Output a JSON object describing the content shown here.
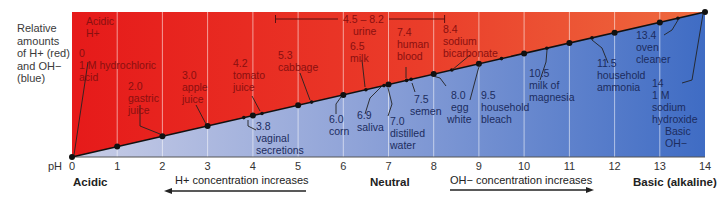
{
  "side_label": {
    "line1": "Relative",
    "line2": "amounts",
    "line3": "of H+ (red)",
    "line4": "and OH−",
    "line5": "(blue)"
  },
  "axis": {
    "ph_label": "pH",
    "ticks": [
      "0",
      "1",
      "2",
      "3",
      "4",
      "5",
      "6",
      "7",
      "8",
      "9",
      "10",
      "11",
      "12",
      "13",
      "14"
    ],
    "acidic": "Acidic",
    "neutral": "Neutral",
    "basic": "Basic (alkaline)"
  },
  "arrows": {
    "left": "H+ concentration increases",
    "right": "OH−  concentration increases"
  },
  "corners": {
    "acidic_top": "Acidic",
    "acidic_ion": "H+",
    "basic_bottom": "Basic",
    "basic_ion": "OH−"
  },
  "colors": {
    "acid_red": "#e8221c",
    "acid_red_light": "#ec5a3a",
    "base_blue": "#4a72c4",
    "base_blue_light": "#b8c4e2",
    "line": "#111111"
  },
  "substances": [
    {
      "ph": "0",
      "name1": "1 M hydrochloric",
      "name2": "acid",
      "side": "red"
    },
    {
      "ph": "2.0",
      "name1": "gastric",
      "name2": "juice",
      "side": "red"
    },
    {
      "ph": "3.0",
      "name1": "apple",
      "name2": "juice",
      "side": "red"
    },
    {
      "ph": "3.8",
      "name1": "vaginal",
      "name2": "secretions",
      "side": "blue"
    },
    {
      "ph": "4.2",
      "name1": "tomato",
      "name2": "juice",
      "side": "red"
    },
    {
      "ph": "5.3",
      "name1": "cabbage",
      "name2": "",
      "side": "red"
    },
    {
      "ph": "6.0",
      "name1": "corn",
      "name2": "",
      "side": "blue"
    },
    {
      "ph": "6.5",
      "name1": "milk",
      "name2": "",
      "side": "red"
    },
    {
      "ph": "6.9",
      "name1": "saliva",
      "name2": "",
      "side": "blue"
    },
    {
      "ph": "7.0",
      "name1": "distilled",
      "name2": "water",
      "side": "blue"
    },
    {
      "ph": "7.4",
      "name1": "human",
      "name2": "blood",
      "side": "red"
    },
    {
      "ph": "7.5",
      "name1": "semen",
      "name2": "",
      "side": "blue"
    },
    {
      "ph": "8.0",
      "name1": "egg",
      "name2": "white",
      "side": "blue"
    },
    {
      "ph": "8.4",
      "name1": "sodium",
      "name2": "bicarbonate",
      "side": "red"
    },
    {
      "ph": "9.5",
      "name1": "household",
      "name2": "bleach",
      "side": "blue"
    },
    {
      "ph": "10.5",
      "name1": "milk of",
      "name2": "magnesia",
      "side": "blue"
    },
    {
      "ph": "11.5",
      "name1": "household",
      "name2": "ammonia",
      "side": "blue"
    },
    {
      "ph": "13.4",
      "name1": "oven",
      "name2": "cleaner",
      "side": "blue"
    },
    {
      "ph": "14",
      "name1": "1 M",
      "name2": "sodium",
      "name3": "hydroxide",
      "side": "blue"
    }
  ],
  "urine": {
    "range": "4.5 – 8.2",
    "name": "urine"
  }
}
